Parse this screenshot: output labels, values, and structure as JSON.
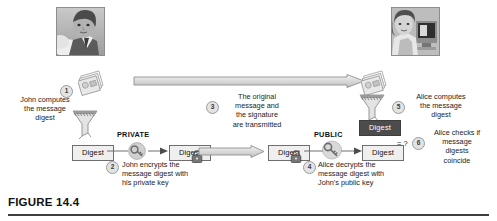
{
  "figure": {
    "label": "FIGURE 14.4"
  },
  "actors": {
    "sender": {
      "name": "John",
      "photo_alt": "man-portrait-photo"
    },
    "receiver": {
      "name": "Alice",
      "photo_alt": "woman-at-computer-photo"
    }
  },
  "steps": [
    {
      "number": "1",
      "text_lines": [
        "John computes",
        "the message",
        "digest"
      ]
    },
    {
      "number": "2",
      "text_lines": [
        "John encrypts the",
        "message digest with",
        "his private key"
      ]
    },
    {
      "number": "3",
      "text_lines": [
        "The original",
        "message and",
        "the signature",
        "are transmitted"
      ]
    },
    {
      "number": "4",
      "text_lines": [
        "Alice decrypts  the",
        "message digest with",
        "John's public key"
      ]
    },
    {
      "number": "5",
      "text_lines": [
        "Alice computes",
        "the message",
        "digest"
      ]
    },
    {
      "number": "6",
      "text_lines": [
        "Alice checks if",
        "message",
        "digests",
        "coincide"
      ]
    }
  ],
  "boxes": {
    "digest_plain_left": "Digest",
    "digest_locked_left": "Digest",
    "digest_locked_right": "Digest",
    "digest_plain_right": "Digest",
    "digest_received": "Digest",
    "digest_computed": "Digest"
  },
  "keys": {
    "private_label": "PRIVATE",
    "public_label": "PUBLIC"
  },
  "comparison": {
    "symbol": "= ?"
  },
  "icons": {
    "document_stack": "document-stack-icon",
    "funnel": "funnel-icon",
    "key": "key-icon",
    "lock": "lock-icon",
    "arrow": "right-arrow-icon"
  },
  "colors": {
    "digest_dark_bg": "#4c4c4c",
    "digest_light_bg": "#efefef",
    "rule": "#3f3f3f",
    "arrow_fill": "#d8d8d8",
    "arrow_stroke": "#8f8f8f"
  }
}
